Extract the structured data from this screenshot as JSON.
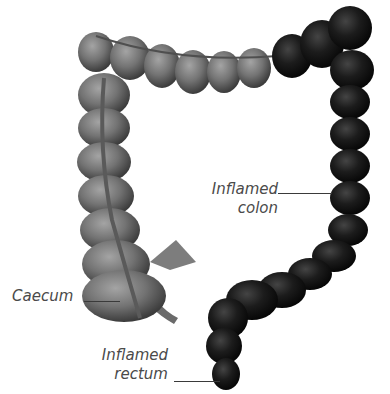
{
  "diagram": {
    "colors": {
      "healthy_tissue": "#6e6e6e",
      "healthy_highlight": "#9a9a9a",
      "inflamed_tissue": "#141414",
      "inflamed_highlight": "#3a3a3a",
      "label_text": "#4a4a4a",
      "leader_line": "#3a3a3a",
      "background": "#ffffff"
    },
    "labels": {
      "inflamed_colon_line1": "Inflamed",
      "inflamed_colon_line2": "colon",
      "caecum": "Caecum",
      "inflamed_rectum_line1": "Inflamed",
      "inflamed_rectum_line2": "rectum"
    }
  }
}
